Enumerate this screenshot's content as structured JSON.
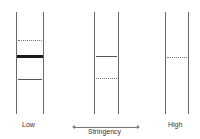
{
  "diagram": {
    "title": "",
    "lanes": [
      {
        "name": "low",
        "label": "Low",
        "left_x": 16,
        "right_x": 43,
        "bands": [
          {
            "y": 40,
            "style": "dotted"
          },
          {
            "y": 56,
            "style": "thick"
          },
          {
            "y": 79,
            "style": "solid"
          }
        ]
      },
      {
        "name": "medium",
        "label": "",
        "left_x": 94,
        "right_x": 118,
        "bands": [
          {
            "y": 56,
            "style": "solid"
          },
          {
            "y": 78,
            "style": "dotted"
          }
        ]
      },
      {
        "name": "high",
        "label": "High",
        "left_x": 165,
        "right_x": 188,
        "bands": [
          {
            "y": 57,
            "style": "dotted"
          }
        ]
      }
    ],
    "axis": {
      "label": "Stringency",
      "direction": "bidirectional"
    }
  },
  "colors": {
    "rail": "#6a6a6a",
    "thick_band": "#1a1a1a",
    "solid_band": "#555555",
    "dotted_band": "#777777",
    "text": "#333333"
  }
}
